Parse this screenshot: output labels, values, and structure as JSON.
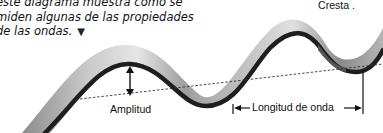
{
  "caption": {
    "lines": [
      "este diagrama muestra cómo se",
      "miden algunas de las propiedades",
      "de las ondas."
    ],
    "pointer_icon": "down-triangle-icon"
  },
  "labels": {
    "crest": "Cresta .",
    "amplitude": "Amplitud",
    "wavelength": "Longitud de onda"
  },
  "colors": {
    "ribbon_light": "#d8d8d8",
    "ribbon_mid": "#9a9a9a",
    "ribbon_edge": "#1e1e1e",
    "annotation": "#111111"
  }
}
